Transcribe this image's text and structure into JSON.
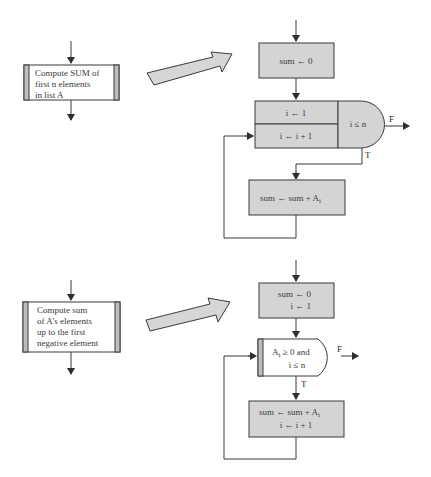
{
  "figure": {
    "top": {
      "predefined_process": {
        "lines": [
          "Compute SUM of",
          "first n elements",
          "in list A"
        ]
      },
      "init_box": {
        "lines": [
          "sum ← 0"
        ]
      },
      "loop_box": {
        "init": "i ← 1",
        "increment": "i ← i + 1",
        "condition": "i ≤ n",
        "false_label": "F",
        "true_label": "T"
      },
      "body_box": {
        "text": "sum ← sum + A",
        "subscript": "i"
      }
    },
    "bottom": {
      "predefined_process": {
        "lines": [
          "Compute sum",
          "of A’s elements",
          "up to the first",
          "negative element"
        ]
      },
      "init_box": {
        "lines": [
          "sum ← 0",
          "i ← 1"
        ]
      },
      "decision": {
        "line1_prefix": "A",
        "line1_sub": "i",
        "line1_suffix": " ≥ 0 and",
        "line2": "i ≤ n",
        "false_label": "F",
        "true_label": "T"
      },
      "body_box": {
        "line1": "sum ← sum + A",
        "line1_sub": "i",
        "line2": "i ← i + 1"
      }
    },
    "colors": {
      "fill": "#d4d4d4",
      "stroke": "#3a3a3a"
    }
  }
}
